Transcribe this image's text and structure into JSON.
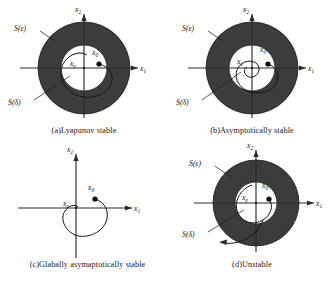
{
  "figure": {
    "background_color": "#ffffff",
    "annulus_color": "#3c3c3c",
    "stroke_color": "#1f1f1f",
    "panels": [
      {
        "id": "a",
        "caption": "(a)Lyapunov stable",
        "has_annulus": true,
        "labels": {
          "outer_set": "S(ε)",
          "inner_set": "S(δ)",
          "equilibrium": "x",
          "equilibrium_sub": "e",
          "initial": "x",
          "initial_sub": "0",
          "x_axis": "x",
          "x_axis_sub": "1",
          "y_axis": "x",
          "y_axis_sub": "2"
        },
        "trajectory": "bounded-spiral-stays-inside-epsilon"
      },
      {
        "id": "b",
        "caption": "(b)Asymptotically stable",
        "has_annulus": true,
        "labels": {
          "outer_set": "S(ε)",
          "inner_set": "S(δ)",
          "equilibrium": "x",
          "equilibrium_sub": "e",
          "initial": "x",
          "initial_sub": "0",
          "x_axis": "x",
          "x_axis_sub": "1",
          "y_axis": "x",
          "y_axis_sub": "2"
        },
        "trajectory": "inward-spiral-converging-to-equilibrium"
      },
      {
        "id": "c",
        "caption": "(c)Glabally asymaptotically stable",
        "has_annulus": false,
        "labels": {
          "equilibrium": "x",
          "equilibrium_sub": "e",
          "initial": "x",
          "initial_sub": "0",
          "x_axis": "x",
          "x_axis_sub": "1",
          "y_axis": "x",
          "y_axis_sub": "2"
        },
        "trajectory": "loop-converging-to-origin-from-anywhere"
      },
      {
        "id": "d",
        "caption": "(d)Unstable",
        "has_annulus": true,
        "labels": {
          "outer_set": "S(ε)",
          "inner_set": "S(δ)",
          "equilibrium": "x",
          "equilibrium_sub": "e",
          "initial": "x",
          "initial_sub": "0",
          "x_axis": "x",
          "x_axis_sub": "1",
          "y_axis": "x",
          "y_axis_sub": "2"
        },
        "trajectory": "outward-spiral-escaping-epsilon-with-arrow"
      }
    ]
  }
}
